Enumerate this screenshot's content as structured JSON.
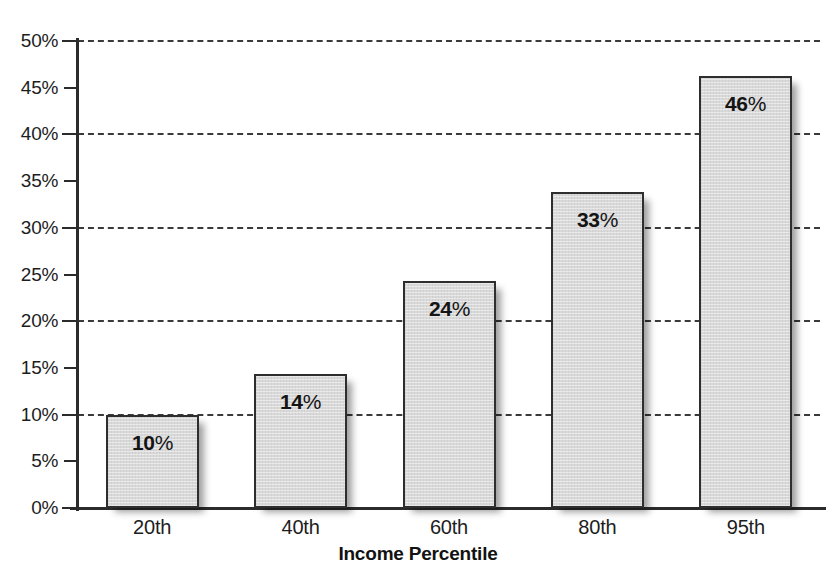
{
  "chart_data": {
    "type": "bar",
    "title": "",
    "xlabel": "Income Percentile",
    "ylabel": "",
    "categories": [
      "20th",
      "40th",
      "60th",
      "80th",
      "95th"
    ],
    "values": [
      10,
      14.4,
      24.3,
      33.8,
      46.3
    ],
    "data_labels": [
      "10%",
      "14%",
      "24%",
      "33%",
      "46%"
    ],
    "ylim": [
      0,
      50
    ],
    "ytick_labels": [
      "0%",
      "5%",
      "10%",
      "15%",
      "20%",
      "25%",
      "30%",
      "35%",
      "40%",
      "45%",
      "50%"
    ],
    "ytick_values": [
      0,
      5,
      10,
      15,
      20,
      25,
      30,
      35,
      40,
      45,
      50
    ],
    "gridline_values": [
      10,
      20,
      30,
      40,
      50
    ],
    "grid": "horizontal-dashed-at-10-percent-steps",
    "legend": "none",
    "bar_fill_color": "#d9d9d9",
    "bar_border_color": "#2e2e2e",
    "axis_color": "#2b2b2b",
    "text_color": "#1d1d1d"
  },
  "series_labels": [
    {
      "num": "10",
      "pct": "%"
    },
    {
      "num": "14",
      "pct": "%"
    },
    {
      "num": "24",
      "pct": "%"
    },
    {
      "num": "33",
      "pct": "%"
    },
    {
      "num": "46",
      "pct": "%"
    }
  ],
  "axis": {
    "x_title": "Income Percentile"
  },
  "cropped_title_text": ""
}
